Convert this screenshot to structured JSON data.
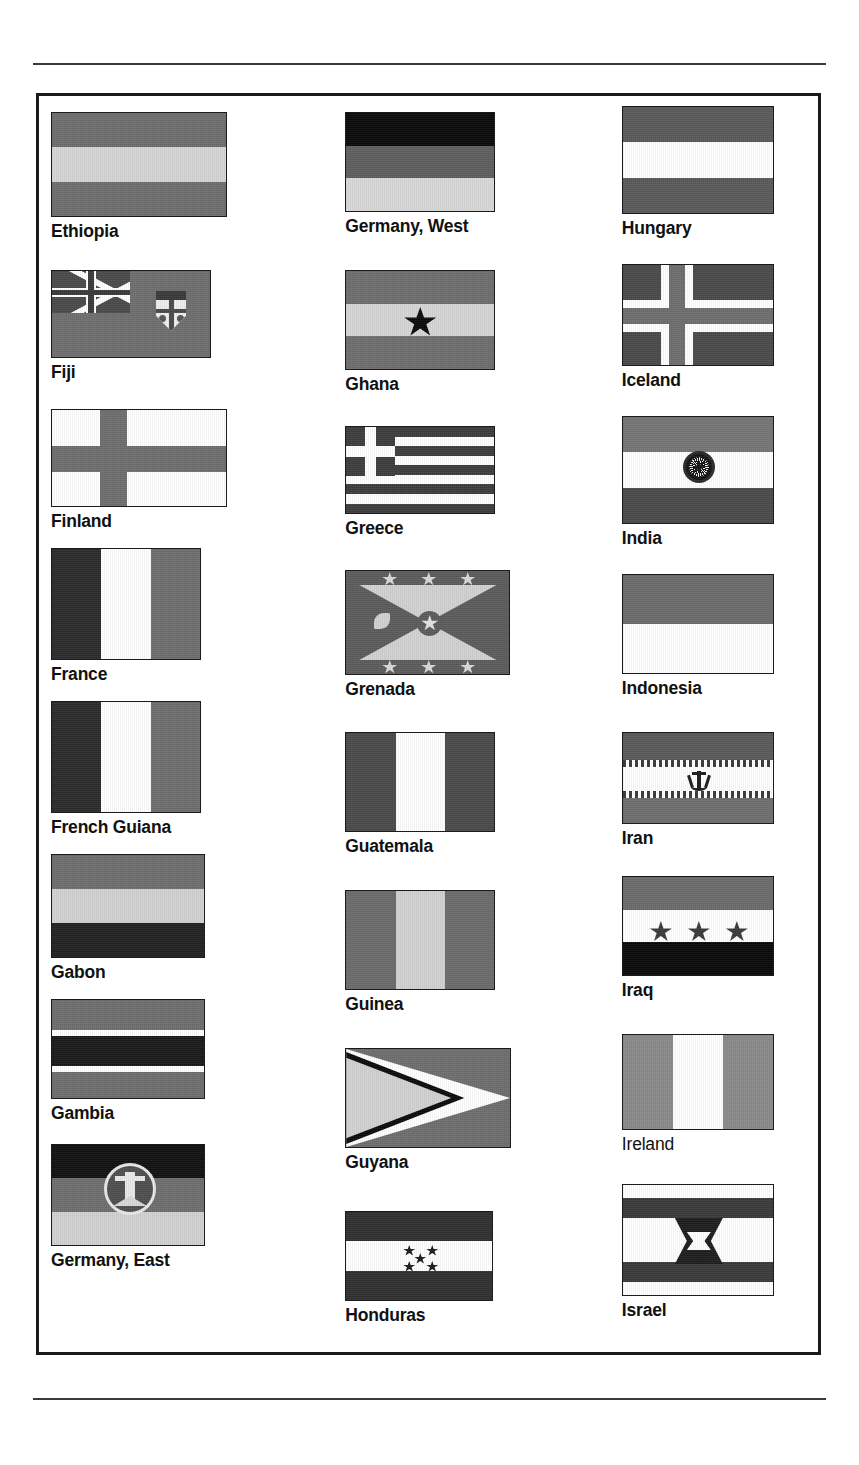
{
  "page": {
    "section": "Ethiopia through Israel",
    "layout": "3-column flag reference plate",
    "columns": 3,
    "rows_per_column": 8
  },
  "palette": {
    "ink_black": "#111111",
    "dark_gray": "#3f3f3f",
    "mid_gray": "#6e6e6e",
    "light_gray": "#d2d2d2",
    "white": "#ffffff",
    "border": "#1b1b1b",
    "rule": "#3a3a3a"
  },
  "columns": [
    {
      "name": "column-1",
      "flags": [
        {
          "name": "Ethiopia",
          "bold": true,
          "type": "horizontal-tricolor",
          "bands": [
            "#6e6e6e",
            "#d6d6d6",
            "#6e6e6e"
          ],
          "w": 176,
          "h": 105
        },
        {
          "name": "Fiji",
          "bold": true,
          "type": "ensign-canton-badge",
          "field": "#6e6e6e",
          "w": 160,
          "h": 88
        },
        {
          "name": "Finland",
          "bold": true,
          "type": "nordic-cross",
          "field": "#ffffff",
          "cross": "#6e6e6e",
          "w": 176,
          "h": 98
        },
        {
          "name": "France",
          "bold": true,
          "type": "vertical-tricolor",
          "bands": [
            "#2b2b2b",
            "#ffffff",
            "#6e6e6e"
          ],
          "w": 150,
          "h": 112
        },
        {
          "name": "French Guiana",
          "bold": true,
          "type": "vertical-tricolor",
          "bands": [
            "#2b2b2b",
            "#ffffff",
            "#6e6e6e"
          ],
          "w": 150,
          "h": 112
        },
        {
          "name": "Gabon",
          "bold": true,
          "type": "horizontal-tricolor",
          "bands": [
            "#6e6e6e",
            "#d2d2d2",
            "#222222"
          ],
          "w": 154,
          "h": 104
        },
        {
          "name": "Gambia",
          "bold": true,
          "type": "horizontal-five-band",
          "bands": [
            "#6e6e6e",
            "#ffffff",
            "#1a1a1a",
            "#ffffff",
            "#6e6e6e"
          ],
          "w": 154,
          "h": 100
        },
        {
          "name": "Germany, East",
          "bold": true,
          "type": "horizontal-tricolor-emblem",
          "bands": [
            "#111111",
            "#6e6e6e",
            "#d2d2d2"
          ],
          "w": 154,
          "h": 102
        }
      ]
    },
    {
      "name": "column-2",
      "flags": [
        {
          "name": "Germany, West",
          "bold": true,
          "type": "horizontal-tricolor",
          "bands": [
            "#0b0b0b",
            "#5f5f5f",
            "#d9d9d9"
          ],
          "w": 150,
          "h": 100
        },
        {
          "name": "Ghana",
          "bold": true,
          "type": "horizontal-tricolor-star",
          "bands": [
            "#6e6e6e",
            "#d6d6d6",
            "#6e6e6e"
          ],
          "w": 150,
          "h": 100
        },
        {
          "name": "Greece",
          "bold": true,
          "type": "nine-stripes-canton-cross",
          "stripe": "#3d3d3d",
          "w": 150,
          "h": 88
        },
        {
          "name": "Grenada",
          "bold": true,
          "type": "saltire-stars",
          "field": "#5c5c5c",
          "triangles": "#d2d2d2",
          "w": 165,
          "h": 105
        },
        {
          "name": "Guatemala",
          "bold": true,
          "type": "vertical-tricolor",
          "bands": [
            "#4a4a4a",
            "#ffffff",
            "#4a4a4a"
          ],
          "w": 150,
          "h": 100
        },
        {
          "name": "Guinea",
          "bold": true,
          "type": "vertical-tricolor",
          "bands": [
            "#6b6b6b",
            "#d2d2d2",
            "#6b6b6b"
          ],
          "w": 150,
          "h": 100
        },
        {
          "name": "Guyana",
          "bold": true,
          "type": "chevron-arrowhead",
          "field": "#6e6e6e",
          "w": 166,
          "h": 100
        },
        {
          "name": "Honduras",
          "bold": true,
          "type": "horizontal-tricolor-stars",
          "bands": [
            "#2f2f2f",
            "#ffffff",
            "#2f2f2f"
          ],
          "w": 148,
          "h": 90
        }
      ]
    },
    {
      "name": "column-3",
      "flags": [
        {
          "name": "Hungary",
          "bold": true,
          "type": "horizontal-tricolor",
          "bands": [
            "#5a5a5a",
            "#ffffff",
            "#5a5a5a"
          ],
          "w": 152,
          "h": 108
        },
        {
          "name": "Iceland",
          "bold": true,
          "type": "nordic-cross-outlined",
          "field": "#4a4a4a",
          "outer": "#ffffff",
          "inner": "#6e6e6e",
          "w": 152,
          "h": 102
        },
        {
          "name": "India",
          "bold": true,
          "type": "horizontal-tricolor-chakra",
          "bands": [
            "#757575",
            "#ffffff",
            "#4a4a4a"
          ],
          "w": 152,
          "h": 108
        },
        {
          "name": "Indonesia",
          "bold": true,
          "type": "horizontal-bicolor",
          "bands": [
            "#6b6b6b",
            "#ffffff"
          ],
          "w": 152,
          "h": 100
        },
        {
          "name": "Iran",
          "bold": true,
          "type": "horizontal-tricolor-emblem",
          "bands": [
            "#5a5a5a",
            "#ffffff",
            "#6e6e6e"
          ],
          "w": 152,
          "h": 92
        },
        {
          "name": "Iraq",
          "bold": true,
          "type": "horizontal-tricolor-stars",
          "bands": [
            "#6b6b6b",
            "#ffffff",
            "#0a0a0a"
          ],
          "w": 152,
          "h": 100
        },
        {
          "name": "Ireland",
          "bold": false,
          "type": "vertical-tricolor",
          "bands": [
            "#8a8a8a",
            "#ffffff",
            "#8a8a8a"
          ],
          "w": 152,
          "h": 96
        },
        {
          "name": "Israel",
          "bold": true,
          "type": "two-bands-star-of-david",
          "field": "#ffffff",
          "band": "#3a3a3a",
          "w": 152,
          "h": 112
        }
      ]
    }
  ]
}
